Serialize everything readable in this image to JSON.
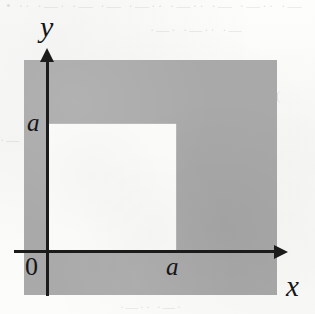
{
  "figure": {
    "kind": "cartesian-shaded-region-diagram",
    "background_color": "#fbfbfa",
    "shaded_color": "#a9a9a9",
    "notch_color": "#fafaf8",
    "axis_color": "#1b1b1b"
  },
  "axes": {
    "y_axis": {
      "label": "y",
      "arrow": "arrow-up",
      "tick_labels": [
        "a"
      ]
    },
    "x_axis": {
      "label": "x",
      "arrow": "arrow-right",
      "tick_labels": [
        "a"
      ]
    },
    "origin": {
      "label": "0"
    }
  },
  "labels": {
    "y_axis_label": "y",
    "x_axis_label": "x",
    "origin_label": "0",
    "y_tick_a": "a",
    "x_tick_a": "a"
  },
  "chart_data": {
    "type": "area",
    "title": "",
    "xlabel": "x",
    "ylabel": "y",
    "xlim": [
      -0.19,
      1.81
    ],
    "ylim": [
      -0.34,
      1.47
    ],
    "grid": false,
    "legend": null,
    "axis_tick_labels": {
      "x": [
        "0",
        "a"
      ],
      "y": [
        "a"
      ]
    },
    "regions": [
      {
        "name": "shaded-square",
        "fill": "#a9a9a9",
        "description": "large shaded rectangle spanning both sides of the origin",
        "x_range": [
          -0.19,
          1.81
        ],
        "y_range": [
          -0.34,
          1.47
        ]
      },
      {
        "name": "square-notch",
        "fill": "#fafaf8",
        "description": "unshaded square of side a with corner at the origin in the first quadrant",
        "x_range": [
          0.0,
          1.0
        ],
        "y_range": [
          0.0,
          1.0
        ]
      }
    ],
    "annotations": [
      {
        "text": "a",
        "axis": "y",
        "value": 1.0
      },
      {
        "text": "a",
        "axis": "x",
        "value": 1.0
      },
      {
        "text": "0",
        "axis": "origin",
        "value": 0
      }
    ]
  },
  "scan_artifacts": {
    "ghost_lines": [
      "• ·· ·—· ·—  ·— ·—··  ·—·· ·—  ·—·· ·—",
      "·—· ·—·· ·—",
      "(",
      "·— ·—·",
      "·—·· ·—·"
    ]
  }
}
